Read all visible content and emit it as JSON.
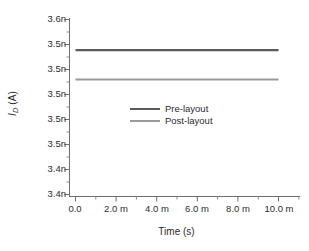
{
  "chart_data": {
    "type": "line",
    "title": "",
    "xlabel": "Time (s)",
    "ylabel": "I_D (A)",
    "ylabel_parts": {
      "symbol": "I",
      "subscript": "D",
      "unit": "(A)"
    },
    "xlim": [
      0,
      0.01
    ],
    "ylim": [
      3.445e-09,
      3.6e-09
    ],
    "grid": false,
    "legend_position": "center",
    "x": [
      0.0,
      0.01
    ],
    "xtick_values": [
      0.0,
      0.002,
      0.004,
      0.006,
      0.008,
      0.01
    ],
    "xtick_labels": [
      "0.0",
      "2.0 m",
      "4.0 m",
      "6.0 m",
      "8.0 m",
      "10.0 m"
    ],
    "ytick_values": [
      3.6e-09,
      3.58e-09,
      3.56e-09,
      3.54e-09,
      3.52e-09,
      3.5e-09,
      3.48e-09,
      3.46e-09
    ],
    "ytick_labels": [
      "3.6n",
      "3.5n",
      "3.5n",
      "3.5n",
      "3.5n",
      "3.5n",
      "3.4n",
      "3.4n"
    ],
    "series": [
      {
        "name": "Pre-layout",
        "color": "#5a5a5a",
        "values": [
          3.5755e-09,
          3.5755e-09
        ],
        "x": [
          0.0,
          0.01
        ]
      },
      {
        "name": "Post-layout",
        "color": "#9a9a9a",
        "values": [
          3.552e-09,
          3.552e-09
        ],
        "x": [
          0.0,
          0.01
        ]
      }
    ]
  },
  "legend": {
    "items": [
      {
        "label": "Pre-layout",
        "color": "#5a5a5a"
      },
      {
        "label": "Post-layout",
        "color": "#9a9a9a"
      }
    ]
  },
  "axes": {
    "x_title": "Time (s)",
    "y_title_symbol": "I",
    "y_title_sub": "D",
    "y_title_unit": " (A)",
    "x_tick_labels": [
      "0.0",
      "2.0 m",
      "4.0 m",
      "6.0 m",
      "8.0 m",
      "10.0 m"
    ],
    "y_tick_labels": [
      "3.6n",
      "3.5n",
      "3.5n",
      "3.5n",
      "3.5n",
      "3.5n",
      "3.4n",
      "3.4n"
    ],
    "axis_color": "#6e6e6e"
  }
}
